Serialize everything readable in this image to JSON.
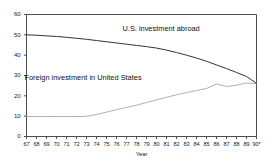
{
  "chart_data": {
    "type": "line",
    "title": "",
    "subtitle": "",
    "xlabel": "Year",
    "ylabel": "",
    "xlim": [
      67,
      90
    ],
    "ylim": [
      0,
      60
    ],
    "grid": false,
    "legend_position": "inline-annotation",
    "y_ticks": [
      "0",
      "10",
      "20",
      "30",
      "40",
      "50",
      "60"
    ],
    "y_tick_values": [
      0,
      10,
      20,
      30,
      40,
      50,
      60
    ],
    "x_ticks": [
      "67",
      "68",
      "69",
      "70",
      "71",
      "72",
      "73",
      "74",
      "75",
      "76",
      "77",
      "78",
      "79",
      "80",
      "81",
      "82",
      "83",
      "84",
      "85",
      "86",
      "87",
      "88",
      "89",
      "90*"
    ],
    "x_tick_values": [
      67,
      68,
      69,
      70,
      71,
      72,
      73,
      74,
      75,
      76,
      77,
      78,
      79,
      80,
      81,
      82,
      83,
      84,
      85,
      86,
      87,
      88,
      89,
      90
    ],
    "x_last_tick_note": "*",
    "series": [
      {
        "name": "U.S. investment abroad",
        "color": "#333333",
        "label_x": 81,
        "label_y": 53,
        "values": [
          50.0,
          49.8,
          49.5,
          49.2,
          48.8,
          48.3,
          47.8,
          47.2,
          46.6,
          46.0,
          45.4,
          44.8,
          44.2,
          43.5,
          42.5,
          41.3,
          40.0,
          38.6,
          37.0,
          35.2,
          33.4,
          31.5,
          29.5,
          26.2
        ]
      },
      {
        "name": "Foreign investment in United States",
        "color": "#b0b0b0",
        "label_x": 72,
        "label_y": 29,
        "values": [
          9.8,
          9.8,
          9.8,
          9.8,
          9.8,
          9.8,
          9.9,
          10.8,
          12.0,
          13.2,
          14.3,
          15.4,
          16.7,
          18.0,
          19.3,
          20.5,
          21.6,
          22.6,
          23.6,
          25.8,
          24.6,
          25.2,
          26.3,
          26.0
        ]
      }
    ],
    "annotations": [
      {
        "text": "U.S. investment abroad"
      },
      {
        "text": "Foreign investment in United States"
      }
    ]
  },
  "axis": {
    "x_title": "Year"
  },
  "colors": {
    "frame": "#4d4d4d",
    "series_upper": "#333333",
    "series_lower": "#b0b0b0",
    "text": "#1a1a1a",
    "background": "#ffffff"
  }
}
